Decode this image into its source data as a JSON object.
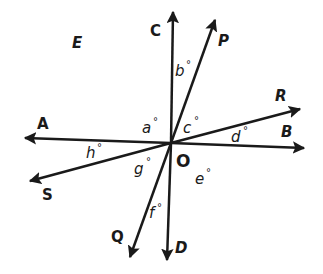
{
  "diagram": {
    "center": {
      "label": "O"
    },
    "region_label": "E",
    "rays": [
      {
        "label": "C"
      },
      {
        "label": "P"
      },
      {
        "label": "R"
      },
      {
        "label": "B"
      },
      {
        "label": "D"
      },
      {
        "label": "Q"
      },
      {
        "label": "S"
      },
      {
        "label": "A"
      }
    ],
    "angles": [
      {
        "var": "a",
        "degree": "°"
      },
      {
        "var": "b",
        "degree": "°"
      },
      {
        "var": "c",
        "degree": "°"
      },
      {
        "var": "d",
        "degree": "°"
      },
      {
        "var": "e",
        "degree": "°"
      },
      {
        "var": "f",
        "degree": "°"
      },
      {
        "var": "g",
        "degree": "°"
      },
      {
        "var": "h",
        "degree": "°"
      }
    ],
    "colors": {
      "line": "#1a1a1a",
      "background": "#ffffff"
    }
  }
}
